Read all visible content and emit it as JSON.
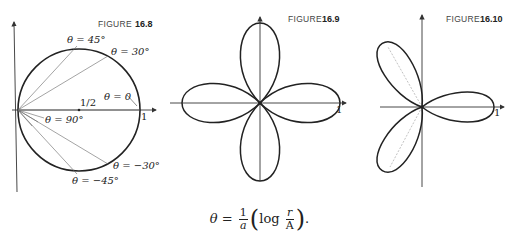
{
  "figures": [
    {
      "caption_word": "FIGURE",
      "caption_number": "16.8",
      "labels": {
        "theta45": "θ = 45°",
        "theta30": "θ = 30°",
        "theta0": "θ = 0",
        "half": "1/2",
        "one": "1",
        "theta90": "θ = 90°",
        "thetam30": "θ = −30°",
        "thetam45": "θ = −45°"
      }
    },
    {
      "caption_word": "FIGURE",
      "caption_number": "16.9",
      "labels": {
        "one": "1"
      }
    },
    {
      "caption_word": "FIGURE",
      "caption_number": "16.10",
      "labels": {
        "one": "1"
      }
    }
  ],
  "equation": {
    "lhs": "θ =",
    "frac1_num": "1",
    "frac1_den": "a",
    "log": "log",
    "frac2_num": "r",
    "frac2_den": "A",
    "tail": "."
  }
}
